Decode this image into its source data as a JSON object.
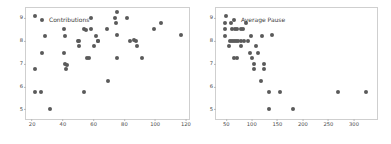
{
  "figure": {
    "width": 391,
    "height": 144,
    "background": "#ffffff",
    "marker_color": "#5a5a5a",
    "axis_color": "#cfcfcf",
    "tick_label_color": "#4a4a4a"
  },
  "chart_data": [
    {
      "type": "scatter",
      "title": "",
      "legend": [
        "Contributions"
      ],
      "legend_position": "upper left",
      "xlabel": "",
      "ylabel": "",
      "xlim": [
        16,
        122
      ],
      "ylim": [
        4.6,
        9.45
      ],
      "xticks": [
        20,
        40,
        60,
        80,
        100,
        120
      ],
      "yticks": [
        5,
        6,
        7,
        8,
        9
      ],
      "xtick_labels": [
        "20",
        "40",
        "60",
        "80",
        "100",
        "120"
      ],
      "ytick_labels": [
        "5",
        "6",
        "7",
        "8",
        "9"
      ],
      "grid": false,
      "series": [
        {
          "name": "Contributions",
          "marker": "o",
          "color": "#5a5a5a",
          "points": [
            [
              22.0,
              9.12
            ],
            [
              22.0,
              6.78
            ],
            [
              22.0,
              5.78
            ],
            [
              25.5,
              5.78
            ],
            [
              26.5,
              7.5
            ],
            [
              28.5,
              8.22
            ],
            [
              31.5,
              5.02
            ],
            [
              40.5,
              8.52
            ],
            [
              41.0,
              7.5
            ],
            [
              41.5,
              8.22
            ],
            [
              41.5,
              7.02
            ],
            [
              42.0,
              6.78
            ],
            [
              42.5,
              6.98
            ],
            [
              49.5,
              8.02
            ],
            [
              50.5,
              8.02
            ],
            [
              50.5,
              7.78
            ],
            [
              53.5,
              8.52
            ],
            [
              53.5,
              5.78
            ],
            [
              55.0,
              8.5
            ],
            [
              55.5,
              7.28
            ],
            [
              57.0,
              7.28
            ],
            [
              58.0,
              9.02
            ],
            [
              58.5,
              8.52
            ],
            [
              60.0,
              7.78
            ],
            [
              61.5,
              8.22
            ],
            [
              62.5,
              8.02
            ],
            [
              63.0,
              8.02
            ],
            [
              68.5,
              8.52
            ],
            [
              69.0,
              6.28
            ],
            [
              74.0,
              9.02
            ],
            [
              74.5,
              8.78
            ],
            [
              75.0,
              9.28
            ],
            [
              75.0,
              8.25
            ],
            [
              75.5,
              7.28
            ],
            [
              81.5,
              9.02
            ],
            [
              83.5,
              8.02
            ],
            [
              86.0,
              8.05
            ],
            [
              87.5,
              8.02
            ],
            [
              88.5,
              7.78
            ],
            [
              91.5,
              7.28
            ],
            [
              99.0,
              8.55
            ],
            [
              104.0,
              8.78
            ],
            [
              116.5,
              8.25
            ]
          ]
        }
      ]
    },
    {
      "type": "scatter",
      "title": "",
      "legend": [
        "Average Pause"
      ],
      "legend_position": "upper left",
      "xlabel": "",
      "ylabel": "",
      "xlim": [
        30,
        345
      ],
      "ylim": [
        4.6,
        9.45
      ],
      "xticks": [
        50,
        100,
        150,
        200,
        250,
        300
      ],
      "yticks": [
        5,
        6,
        7,
        8,
        9
      ],
      "xtick_labels": [
        "50",
        "100",
        "150",
        "200",
        "250",
        "300"
      ],
      "ytick_labels": [
        "5",
        "6",
        "7",
        "8",
        "9"
      ],
      "grid": false,
      "series": [
        {
          "name": "Average Pause",
          "marker": "o",
          "color": "#5a5a5a",
          "points": [
            [
              50,
              9.12
            ],
            [
              48,
              8.78
            ],
            [
              48,
              8.52
            ],
            [
              48,
              8.22
            ],
            [
              60,
              8.78
            ],
            [
              62,
              8.52
            ],
            [
              68,
              8.52
            ],
            [
              72,
              8.52
            ],
            [
              78,
              8.52
            ],
            [
              82,
              8.52
            ],
            [
              88,
              8.78
            ],
            [
              58,
              8.02
            ],
            [
              62,
              8.02
            ],
            [
              66,
              8.02
            ],
            [
              70,
              8.02
            ],
            [
              74,
              8.02
            ],
            [
              78,
              8.02
            ],
            [
              84,
              8.02
            ],
            [
              92,
              8.02
            ],
            [
              98,
              8.22
            ],
            [
              120,
              8.22
            ],
            [
              140,
              8.25
            ],
            [
              56,
              7.78
            ],
            [
              78,
              7.78
            ],
            [
              108,
              7.78
            ],
            [
              96,
              7.5
            ],
            [
              112,
              7.5
            ],
            [
              66,
              7.28
            ],
            [
              72,
              7.28
            ],
            [
              100,
              7.28
            ],
            [
              104,
              7.02
            ],
            [
              124,
              7.02
            ],
            [
              104,
              6.78
            ],
            [
              124,
              6.78
            ],
            [
              118,
              6.28
            ],
            [
              134,
              5.78
            ],
            [
              156,
              5.78
            ],
            [
              268,
              5.78
            ],
            [
              324,
              5.78
            ],
            [
              134,
              5.02
            ],
            [
              180,
              5.02
            ]
          ]
        }
      ]
    }
  ]
}
